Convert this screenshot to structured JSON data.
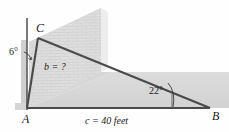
{
  "figure": {
    "background_color": "#fefefe",
    "line_color": "#4a4a4a",
    "wall_fill": "#dcdcdc",
    "ground_fill": "#d9d9d9",
    "text_color": "#1c1c1c"
  },
  "vertices": {
    "A": {
      "label": "A",
      "x": 27,
      "y": 108
    },
    "B": {
      "label": "B",
      "x": 210,
      "y": 108
    },
    "C": {
      "label": "C",
      "x": 38,
      "y": 38
    }
  },
  "angles": {
    "at_A": {
      "label": "6°",
      "value": 6,
      "unit": "degrees"
    },
    "at_B": {
      "label": "22°",
      "value": 22,
      "unit": "degrees"
    }
  },
  "sides": {
    "b": {
      "label": "b = ?",
      "value": null,
      "unknown": true
    },
    "c": {
      "label": "c = 40 feet",
      "value": 40,
      "unit": "feet"
    }
  },
  "icon_names": {
    "leader_line": "leader-line-icon",
    "angle_arc": "angle-arc-icon",
    "brick_hatch": "brick-texture-icon"
  }
}
